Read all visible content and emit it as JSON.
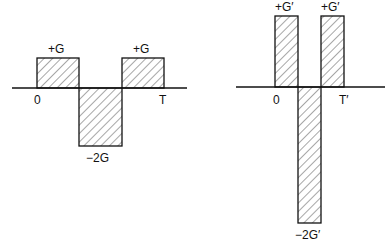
{
  "left": {
    "labels": {
      "pos1": "+G",
      "pos2": "+G",
      "neg": "−2G",
      "zero": "0",
      "end": "T"
    }
  },
  "right": {
    "labels": {
      "pos1": "+G′",
      "pos2": "+G′",
      "neg": "−2G′",
      "zero": "0",
      "end": "T′"
    }
  },
  "colors": {
    "stroke": "#111111",
    "background": "#ffffff"
  }
}
